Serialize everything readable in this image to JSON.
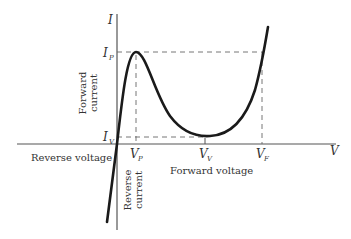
{
  "diagram": {
    "axes": {
      "y_axis_label": "I",
      "x_axis_label": "V"
    },
    "point_labels": {
      "ip": {
        "main": "I",
        "sub": "P"
      },
      "iv": {
        "main": "I",
        "sub": "V"
      },
      "vp": {
        "main": "V",
        "sub": "P"
      },
      "vv": {
        "main": "V",
        "sub": "V"
      },
      "vf": {
        "main": "V",
        "sub": "F"
      }
    },
    "region_labels": {
      "forward_current_line1": "Forward",
      "forward_current_line2": "current",
      "reverse_current_line1": "Reverse",
      "reverse_current_line2": "current",
      "reverse_voltage": "Reverse voltage",
      "forward_voltage": "Forward voltage"
    },
    "colors": {
      "curve": "#1a1a1a",
      "axes": "#555555",
      "dashed": "#666666",
      "text": "#333333"
    }
  }
}
